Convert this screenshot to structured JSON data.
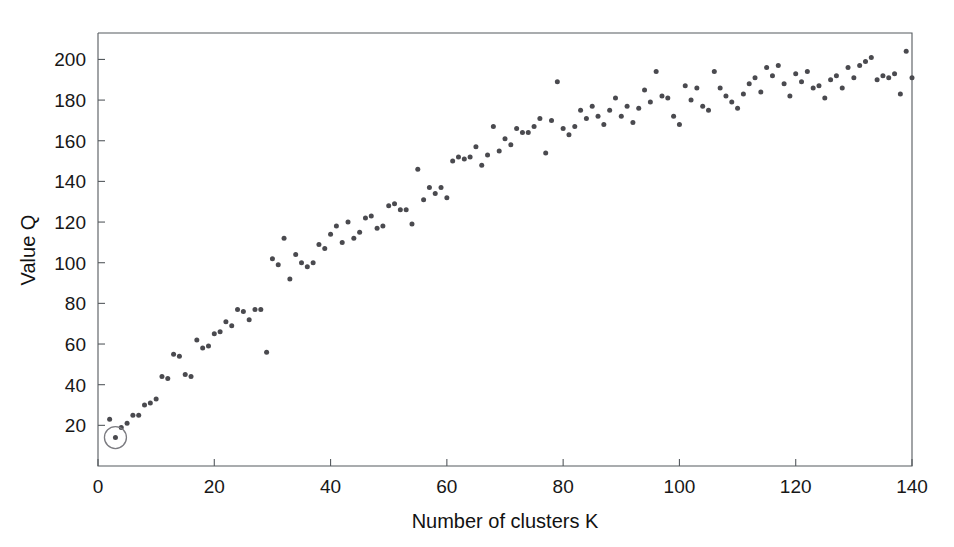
{
  "chart_data": {
    "type": "scatter",
    "title": "",
    "xlabel": "Number of clusters K",
    "ylabel": "Value Q",
    "xlim": [
      0,
      140
    ],
    "ylim": [
      0,
      213
    ],
    "xticks": [
      0,
      20,
      40,
      60,
      80,
      100,
      120,
      140
    ],
    "yticks": [
      20,
      40,
      60,
      80,
      100,
      120,
      140,
      160,
      180,
      200
    ],
    "grid": false,
    "legend": null,
    "marker": {
      "shape": "circle",
      "color": "#4a4a4f",
      "size_px": 5
    },
    "annotations": [
      {
        "kind": "circle-highlight",
        "x": 3,
        "y": 14,
        "color": "#7b7b80",
        "radius_px": 11,
        "note": "selected optimal K marked with open circle"
      }
    ],
    "series": [
      {
        "name": "Q(K)",
        "points": [
          [
            2,
            23
          ],
          [
            3,
            14
          ],
          [
            4,
            19
          ],
          [
            5,
            21
          ],
          [
            6,
            25
          ],
          [
            7,
            25
          ],
          [
            8,
            30
          ],
          [
            9,
            31
          ],
          [
            10,
            33
          ],
          [
            11,
            44
          ],
          [
            12,
            43
          ],
          [
            13,
            55
          ],
          [
            14,
            54
          ],
          [
            15,
            45
          ],
          [
            16,
            44
          ],
          [
            17,
            62
          ],
          [
            18,
            58
          ],
          [
            19,
            59
          ],
          [
            20,
            65
          ],
          [
            21,
            66
          ],
          [
            22,
            71
          ],
          [
            23,
            69
          ],
          [
            24,
            77
          ],
          [
            25,
            76
          ],
          [
            26,
            72
          ],
          [
            27,
            77
          ],
          [
            28,
            77
          ],
          [
            29,
            56
          ],
          [
            30,
            102
          ],
          [
            31,
            99
          ],
          [
            32,
            112
          ],
          [
            33,
            92
          ],
          [
            34,
            104
          ],
          [
            35,
            100
          ],
          [
            36,
            98
          ],
          [
            37,
            100
          ],
          [
            38,
            109
          ],
          [
            39,
            107
          ],
          [
            40,
            114
          ],
          [
            41,
            118
          ],
          [
            42,
            110
          ],
          [
            43,
            120
          ],
          [
            44,
            112
          ],
          [
            45,
            115
          ],
          [
            46,
            122
          ],
          [
            47,
            123
          ],
          [
            48,
            117
          ],
          [
            49,
            118
          ],
          [
            50,
            128
          ],
          [
            51,
            129
          ],
          [
            52,
            126
          ],
          [
            53,
            126
          ],
          [
            54,
            119
          ],
          [
            55,
            146
          ],
          [
            56,
            131
          ],
          [
            57,
            137
          ],
          [
            58,
            134
          ],
          [
            59,
            137
          ],
          [
            60,
            132
          ],
          [
            61,
            150
          ],
          [
            62,
            152
          ],
          [
            63,
            151
          ],
          [
            64,
            152
          ],
          [
            65,
            157
          ],
          [
            66,
            148
          ],
          [
            67,
            153
          ],
          [
            68,
            167
          ],
          [
            69,
            155
          ],
          [
            70,
            161
          ],
          [
            71,
            158
          ],
          [
            72,
            166
          ],
          [
            73,
            164
          ],
          [
            74,
            164
          ],
          [
            75,
            167
          ],
          [
            76,
            171
          ],
          [
            77,
            154
          ],
          [
            78,
            170
          ],
          [
            79,
            189
          ],
          [
            80,
            166
          ],
          [
            81,
            163
          ],
          [
            82,
            167
          ],
          [
            83,
            175
          ],
          [
            84,
            171
          ],
          [
            85,
            177
          ],
          [
            86,
            172
          ],
          [
            87,
            168
          ],
          [
            88,
            175
          ],
          [
            89,
            181
          ],
          [
            90,
            172
          ],
          [
            91,
            177
          ],
          [
            92,
            169
          ],
          [
            93,
            176
          ],
          [
            94,
            185
          ],
          [
            95,
            179
          ],
          [
            96,
            194
          ],
          [
            97,
            182
          ],
          [
            98,
            181
          ],
          [
            99,
            172
          ],
          [
            100,
            168
          ],
          [
            101,
            187
          ],
          [
            102,
            180
          ],
          [
            103,
            186
          ],
          [
            104,
            177
          ],
          [
            105,
            175
          ],
          [
            106,
            194
          ],
          [
            107,
            186
          ],
          [
            108,
            182
          ],
          [
            109,
            179
          ],
          [
            110,
            176
          ],
          [
            111,
            183
          ],
          [
            112,
            188
          ],
          [
            113,
            191
          ],
          [
            114,
            184
          ],
          [
            115,
            196
          ],
          [
            116,
            192
          ],
          [
            117,
            197
          ],
          [
            118,
            188
          ],
          [
            119,
            182
          ],
          [
            120,
            193
          ],
          [
            121,
            189
          ],
          [
            122,
            194
          ],
          [
            123,
            186
          ],
          [
            124,
            187
          ],
          [
            125,
            181
          ],
          [
            126,
            190
          ],
          [
            127,
            192
          ],
          [
            128,
            186
          ],
          [
            129,
            196
          ],
          [
            130,
            191
          ],
          [
            131,
            197
          ],
          [
            132,
            199
          ],
          [
            133,
            201
          ],
          [
            134,
            190
          ],
          [
            135,
            192
          ],
          [
            136,
            191
          ],
          [
            137,
            193
          ],
          [
            138,
            183
          ],
          [
            139,
            204
          ],
          [
            140,
            191
          ]
        ]
      }
    ]
  }
}
